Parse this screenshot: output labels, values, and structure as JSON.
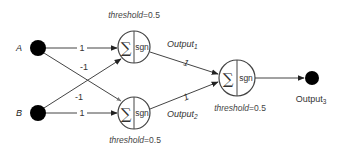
{
  "diagram": {
    "type": "neural-network-xor",
    "inputs": [
      {
        "id": "A",
        "label": "A"
      },
      {
        "id": "B",
        "label": "B"
      }
    ],
    "neurons": [
      {
        "id": "n1",
        "sum_symbol": "∑",
        "activation": "sgn",
        "threshold_label": "threshold",
        "threshold_value": "=0.5",
        "output_label": "Output",
        "output_sub": "1"
      },
      {
        "id": "n2",
        "sum_symbol": "∑",
        "activation": "sgn",
        "threshold_label": "threshold",
        "threshold_value": "=0.5",
        "output_label": "Output",
        "output_sub": "2"
      },
      {
        "id": "n3",
        "sum_symbol": "∑",
        "activation": "sgn",
        "threshold_label": "threshold",
        "threshold_value": "=0.5"
      }
    ],
    "output_node": {
      "label": "Output",
      "sub": "3"
    },
    "edges": [
      {
        "from": "A",
        "to": "n1",
        "weight": "1"
      },
      {
        "from": "A",
        "to": "n2",
        "weight": "-1"
      },
      {
        "from": "B",
        "to": "n1",
        "weight": "-1"
      },
      {
        "from": "B",
        "to": "n2",
        "weight": "1"
      },
      {
        "from": "n1",
        "to": "n3",
        "weight": "1"
      },
      {
        "from": "n2",
        "to": "n3",
        "weight": "1"
      },
      {
        "from": "n3",
        "to": "Output3",
        "weight": ""
      }
    ]
  }
}
